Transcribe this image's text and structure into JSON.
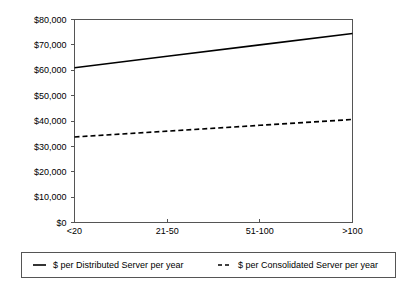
{
  "chart_data": {
    "type": "line",
    "title": "",
    "subtitle": "",
    "xlabel": "",
    "ylabel": "",
    "categories": [
      "<20",
      "21-50",
      "51-100",
      ">100"
    ],
    "ylim": [
      0,
      80000
    ],
    "ytick_labels": [
      "$0",
      "$10,000",
      "$20,000",
      "$30,000",
      "$40,000",
      "$50,000",
      "$60,000",
      "$70,000",
      "$80,000"
    ],
    "ytick_values": [
      0,
      10000,
      20000,
      30000,
      40000,
      50000,
      60000,
      70000,
      80000
    ],
    "grid": false,
    "legend_position": "bottom",
    "series": [
      {
        "name": "$ per Distributed Server per year",
        "style": "solid",
        "color": "#000000",
        "values": [
          61000,
          65500,
          70000,
          74500
        ]
      },
      {
        "name": "$ per Consolidated Server per year",
        "style": "dashed",
        "color": "#000000",
        "values": [
          33700,
          36000,
          38300,
          40600
        ]
      }
    ]
  },
  "legend": {
    "entries": [
      {
        "marker": "solid-line-swatch",
        "label": "$ per Distributed Server per year"
      },
      {
        "marker": "dashed-line-swatch",
        "label": "$ per Consolidated Server per year"
      }
    ]
  }
}
